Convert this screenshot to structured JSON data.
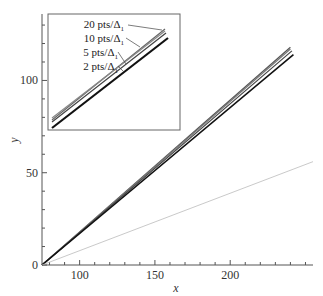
{
  "chart_data": {
    "type": "line",
    "title": "",
    "xlabel": "x",
    "ylabel": "y",
    "xlim": [
      75,
      255
    ],
    "ylim": [
      0,
      136
    ],
    "grid": false,
    "x_ticks": [
      100,
      150,
      200
    ],
    "y_ticks": [
      0,
      50,
      100
    ],
    "x_tick_labels": [
      "100",
      "150",
      "200"
    ],
    "y_tick_labels": [
      "0",
      "50",
      "100"
    ],
    "series": [
      {
        "name": "20 pts/Δ1",
        "color": "#555555",
        "width": 1.2,
        "x": [
          75,
          240
        ],
        "y": [
          0,
          118
        ]
      },
      {
        "name": "10 pts/Δ1",
        "color": "#777777",
        "width": 1.2,
        "x": [
          75,
          240
        ],
        "y": [
          0,
          117
        ]
      },
      {
        "name": "5 pts/Δ1",
        "color": "#444444",
        "width": 1.2,
        "x": [
          75,
          241
        ],
        "y": [
          0,
          116
        ]
      },
      {
        "name": "2 pts/Δ1",
        "color": "#111111",
        "width": 1.6,
        "x": [
          75,
          242
        ],
        "y": [
          0,
          114
        ]
      },
      {
        "name": "reference",
        "color": "#bbbbbb",
        "width": 0.8,
        "x": [
          75,
          255
        ],
        "y": [
          0,
          56
        ]
      }
    ],
    "inset": {
      "labels": [
        "20 pts/Δ1",
        "10 pts/Δ1",
        "5 pts/Δ1",
        "2 pts/Δ1"
      ],
      "legend_position": "upper-left inset"
    }
  }
}
